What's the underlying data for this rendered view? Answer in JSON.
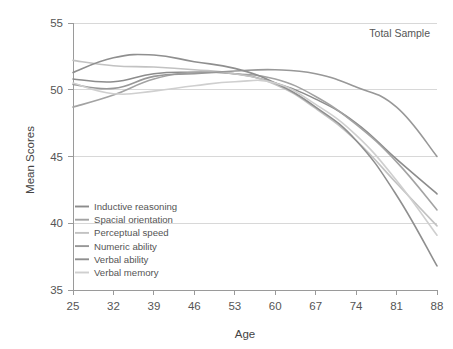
{
  "chart_data": {
    "type": "line",
    "title": "",
    "annotation": "Total Sample",
    "xlabel": "Age",
    "ylabel": "Mean Scores",
    "x": [
      25,
      32,
      39,
      46,
      53,
      60,
      67,
      74,
      81,
      88
    ],
    "categories": [
      "25",
      "32",
      "39",
      "46",
      "53",
      "60",
      "67",
      "74",
      "81",
      "88"
    ],
    "xlim": [
      25,
      88
    ],
    "ylim": [
      35,
      55
    ],
    "yticks": [
      35,
      40,
      45,
      50,
      55
    ],
    "ytick_labels": [
      "35",
      "40",
      "45",
      "50",
      "55"
    ],
    "grid": "horizontal",
    "legend_position": "lower-left",
    "series": [
      {
        "name": "Inductive reasoning",
        "color": "#8c8c8c",
        "values": [
          50.8,
          50.6,
          51.2,
          51.3,
          51.2,
          50.5,
          49.3,
          47.5,
          44.8,
          42.2
        ]
      },
      {
        "name": "Spacial orientation",
        "color": "#a3a3a3",
        "values": [
          48.7,
          49.6,
          50.8,
          51.3,
          51.2,
          50.8,
          49.5,
          47.4,
          44.6,
          41.0
        ]
      },
      {
        "name": "Perceptual speed",
        "color": "#c2c2c2",
        "values": [
          52.2,
          51.8,
          51.7,
          51.5,
          51.2,
          50.4,
          48.6,
          46.2,
          43.0,
          39.8
        ]
      },
      {
        "name": "Numeric ability",
        "color": "#989898",
        "values": [
          50.4,
          50.1,
          51.0,
          51.2,
          51.4,
          51.5,
          51.2,
          50.2,
          48.7,
          45.0
        ]
      },
      {
        "name": "Verbal ability",
        "color": "#8f8f8f",
        "values": [
          51.3,
          52.4,
          52.6,
          52.1,
          51.6,
          50.5,
          48.7,
          46.2,
          42.1,
          36.8
        ]
      },
      {
        "name": "Verbal memory",
        "color": "#cfcfcf",
        "values": [
          50.5,
          49.7,
          49.9,
          50.3,
          50.6,
          50.5,
          48.9,
          46.6,
          43.2,
          39.1
        ]
      }
    ]
  }
}
